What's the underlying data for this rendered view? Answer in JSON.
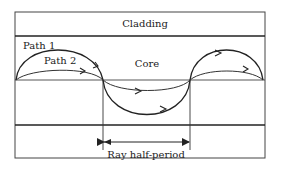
{
  "diagram": {
    "labels": {
      "cladding": "Cladding",
      "core": "Core",
      "path1": "Path 1",
      "path2": "Path 2",
      "half_period": "Ray half-period"
    },
    "colors": {
      "stroke": "#222222",
      "background": "#ffffff"
    }
  }
}
